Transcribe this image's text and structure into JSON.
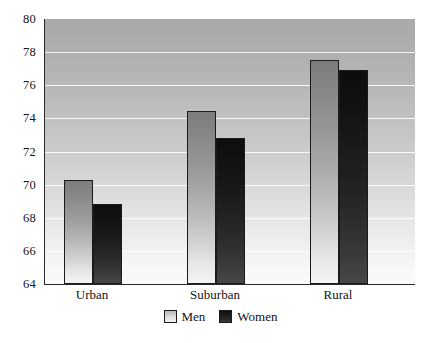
{
  "chart_data": {
    "type": "bar",
    "title": "",
    "subtitle": "",
    "xlabel": "",
    "ylabel": "",
    "categories": [
      "Urban",
      "Suburban",
      "Rural"
    ],
    "series": [
      {
        "name": "Men",
        "values": [
          70.3,
          74.45,
          77.5
        ],
        "color": "#b4b4b4"
      },
      {
        "name": "Women",
        "values": [
          68.85,
          72.8,
          76.9
        ],
        "color": "#1e1e1e"
      }
    ],
    "ylim": [
      64,
      80
    ],
    "yticks": [
      64,
      66,
      68,
      70,
      72,
      74,
      76,
      78,
      80
    ],
    "ytick_labels": [
      "64",
      "66",
      "68",
      "70",
      "72",
      "74",
      "76",
      "78",
      "80"
    ],
    "grid": true,
    "grid_axis": "y",
    "legend": [
      "Men",
      "Women"
    ],
    "legend_position": "bottom-center",
    "background": "#ffffff",
    "plot_background": "gradient-gray-top-to-white-bottom"
  }
}
